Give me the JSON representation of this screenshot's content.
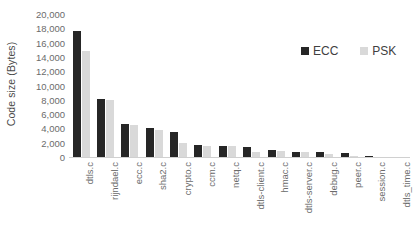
{
  "chart_data": {
    "type": "bar",
    "title": "",
    "xlabel": "",
    "ylabel": "Code size (Bytes)",
    "ylim": [
      0,
      20000
    ],
    "ytick_values": [
      0,
      2000,
      4000,
      6000,
      8000,
      10000,
      12000,
      14000,
      16000,
      18000,
      20000
    ],
    "ytick_labels": [
      "0",
      "2,000",
      "4,000",
      "6,000",
      "8,000",
      "10,000",
      "12,000",
      "14,000",
      "16,000",
      "18,000",
      "20,000"
    ],
    "grid": false,
    "legend_position": "upper right inside",
    "categories": [
      "dtls.c",
      "rijndael.c",
      "ecc.c",
      "sha2.c",
      "crypto.c",
      "ccm.c",
      "netq.c",
      "dtls-client.c",
      "hmac.c",
      "dtls-server.c",
      "debug.c",
      "peer.c",
      "session.c",
      "dtls_time.c"
    ],
    "series": [
      {
        "name": "ECC",
        "color": "#262626",
        "values": [
          17700,
          8200,
          4700,
          4200,
          3700,
          1800,
          1700,
          1500,
          1100,
          900,
          900,
          650,
          350,
          150
        ]
      },
      {
        "name": "PSK",
        "color": "#D9D9D9",
        "values": [
          15000,
          8100,
          4600,
          3900,
          2100,
          1750,
          1650,
          900,
          1050,
          850,
          600,
          250,
          200,
          150
        ]
      }
    ]
  }
}
